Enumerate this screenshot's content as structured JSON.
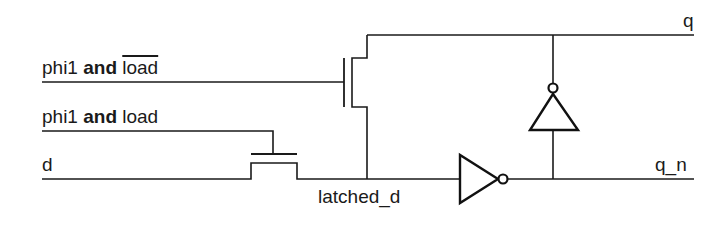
{
  "diagram": {
    "colors": {
      "stroke": "#1a1a1a",
      "background": "#ffffff"
    },
    "signals": {
      "phi1_and_not_load": {
        "prefix": "phi1",
        "operator": "and",
        "operand": "load",
        "operand_negated": true
      },
      "phi1_and_load": {
        "prefix": "phi1",
        "operator": "and",
        "operand": "load",
        "operand_negated": false
      },
      "d": "d",
      "latched_d": "latched_d",
      "q": "q",
      "q_n": "q_n"
    },
    "components": [
      {
        "id": "feedback-transistor",
        "type": "nmos-pass-transistor",
        "gate": "phi1 and load_bar"
      },
      {
        "id": "input-transistor",
        "type": "nmos-pass-transistor",
        "gate": "phi1 and load"
      },
      {
        "id": "forward-inverter",
        "type": "inverter",
        "in": "latched_d",
        "out": "q_n"
      },
      {
        "id": "feedback-inverter",
        "type": "inverter",
        "in": "q_n",
        "out": "q"
      }
    ]
  }
}
